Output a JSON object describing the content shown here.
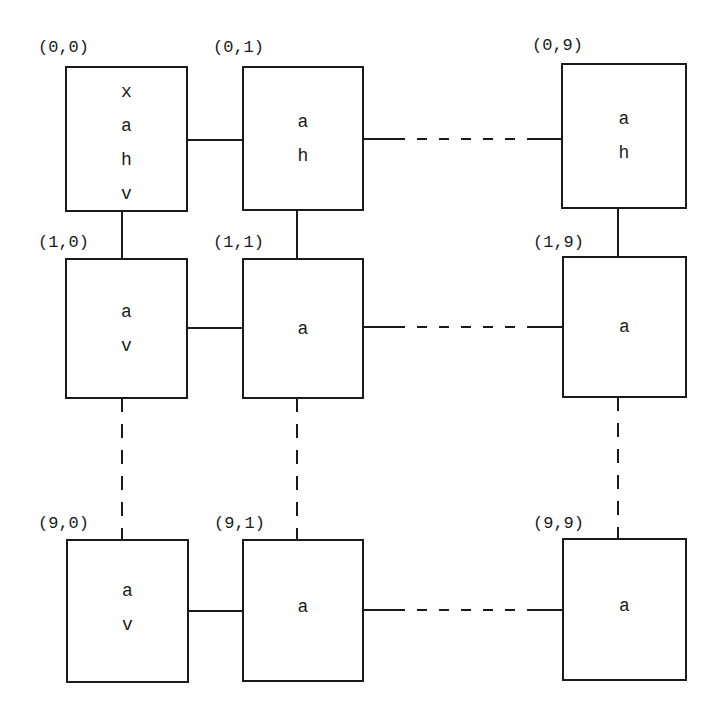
{
  "diagram": {
    "title": "",
    "colors": {
      "line": "#1a1a1a",
      "background": "#ffffff"
    },
    "nodes": [
      {
        "id": "0-0",
        "label": "(0,0)",
        "lines": [
          "x",
          "a",
          "h",
          "v"
        ]
      },
      {
        "id": "0-1",
        "label": "(0,1)",
        "lines": [
          "a",
          "h"
        ]
      },
      {
        "id": "0-9",
        "label": "(0,9)",
        "lines": [
          "a",
          "h"
        ]
      },
      {
        "id": "1-0",
        "label": "(1,0)",
        "lines": [
          "a",
          "v"
        ]
      },
      {
        "id": "1-1",
        "label": "(1,1)",
        "lines": [
          "a"
        ]
      },
      {
        "id": "1-9",
        "label": "(1,9)",
        "lines": [
          "a"
        ]
      },
      {
        "id": "9-0",
        "label": "(9,0)",
        "lines": [
          "a",
          "v"
        ]
      },
      {
        "id": "9-1",
        "label": "(9,1)",
        "lines": [
          "a"
        ]
      },
      {
        "id": "9-9",
        "label": "(9,9)",
        "lines": [
          "a"
        ]
      }
    ],
    "edges": [
      {
        "from": "0-0",
        "to": "0-1",
        "style": "solid"
      },
      {
        "from": "0-1",
        "to": "0-9",
        "style": "dashed"
      },
      {
        "from": "1-0",
        "to": "1-1",
        "style": "solid"
      },
      {
        "from": "1-1",
        "to": "1-9",
        "style": "dashed"
      },
      {
        "from": "9-0",
        "to": "9-1",
        "style": "solid"
      },
      {
        "from": "9-1",
        "to": "9-9",
        "style": "dashed"
      },
      {
        "from": "0-0",
        "to": "1-0",
        "style": "solid"
      },
      {
        "from": "0-1",
        "to": "1-1",
        "style": "solid"
      },
      {
        "from": "0-9",
        "to": "1-9",
        "style": "solid"
      },
      {
        "from": "1-0",
        "to": "9-0",
        "style": "dashed"
      },
      {
        "from": "1-1",
        "to": "9-1",
        "style": "dashed"
      },
      {
        "from": "1-9",
        "to": "9-9",
        "style": "dashed"
      }
    ]
  }
}
